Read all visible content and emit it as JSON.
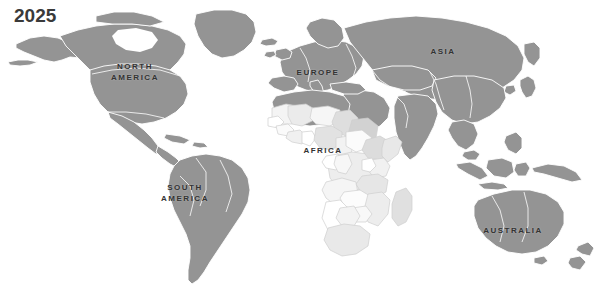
{
  "title": {
    "year": "2025"
  },
  "map": {
    "background_color": "#ffffff",
    "land_color": "#949494",
    "border_color": "#ffffff",
    "highlight_region": "Africa",
    "highlight_colors": [
      "#ffffff",
      "#f2f2f2",
      "#e4e4e4",
      "#d6d6d6",
      "#cacaca"
    ],
    "label_color": "#333333",
    "projection": "world",
    "antarctica_shown": false,
    "labels": [
      {
        "id": "north-america",
        "text": "NORTH\nAMERICA",
        "x": 135,
        "y": 72
      },
      {
        "id": "south-america",
        "text": "SOUTH\nAMERICA",
        "x": 185,
        "y": 193
      },
      {
        "id": "europe",
        "text": "EUROPE",
        "x": 318,
        "y": 72
      },
      {
        "id": "africa",
        "text": "AFRICA",
        "x": 323,
        "y": 150
      },
      {
        "id": "asia",
        "text": "ASIA",
        "x": 443,
        "y": 51
      },
      {
        "id": "australia",
        "text": "AUSTRALIA",
        "x": 513,
        "y": 230
      }
    ]
  }
}
